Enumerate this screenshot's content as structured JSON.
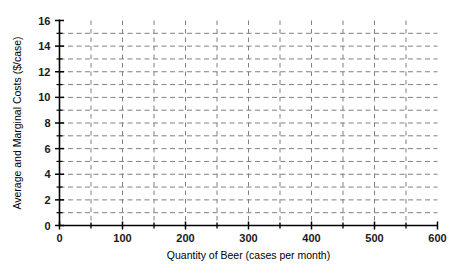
{
  "chart_data": {
    "type": "line",
    "title": "",
    "subtitle": "",
    "xlabel": "Quantity of Beer (cases per month)",
    "ylabel": "Average and Marginal Costs ($/case)",
    "xlim": [
      0,
      600
    ],
    "ylim": [
      0,
      16
    ],
    "x_tick_labels": [
      "0",
      "100",
      "200",
      "300",
      "400",
      "500",
      "600"
    ],
    "x_tick_values": [
      0,
      100,
      200,
      300,
      400,
      500,
      600
    ],
    "x_minor_tick_values": [
      50,
      150,
      250,
      350,
      450,
      550
    ],
    "y_tick_labels": [
      "0",
      "2",
      "4",
      "6",
      "8",
      "10",
      "12",
      "14",
      "16"
    ],
    "y_tick_values": [
      0,
      2,
      4,
      6,
      8,
      10,
      12,
      14,
      16
    ],
    "y_minor_tick_values": [
      1,
      3,
      5,
      7,
      9,
      11,
      13,
      15
    ],
    "grid": true,
    "grid_style": "dashed",
    "grid_color": "#808080",
    "grid_x_values": [
      50,
      100,
      150,
      200,
      250,
      300,
      350,
      400,
      450,
      500,
      550
    ],
    "grid_y_values": [
      1,
      2,
      3,
      4,
      5,
      6,
      7,
      8,
      9,
      10,
      11,
      12,
      13,
      14,
      15
    ],
    "legend": null,
    "legend_position": "none",
    "series": [],
    "annotations": [],
    "axis_color": "#000000",
    "background_color": "#ffffff"
  }
}
